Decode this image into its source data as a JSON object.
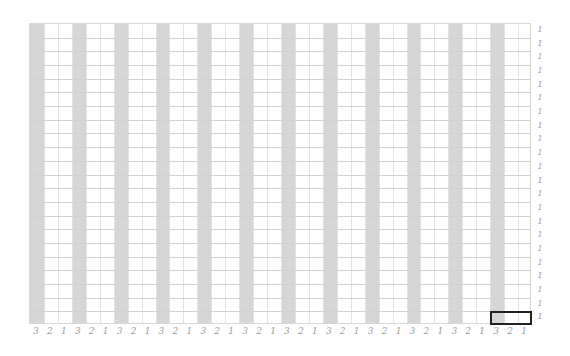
{
  "grid": {
    "columns": 36,
    "rows": 22,
    "left": 29,
    "top": 23,
    "width": 502,
    "height": 301,
    "shaded_every": 3,
    "shaded_offset": 0,
    "shade_color": "#d6d6d6",
    "line_color_vertical": "#e2e2e2",
    "line_color_horizontal": "#d2d2d2",
    "border_color": "#d8d8d8"
  },
  "column_labels": [
    "3",
    "2",
    "1",
    "3",
    "2",
    "1",
    "3",
    "2",
    "1",
    "3",
    "2",
    "1",
    "3",
    "2",
    "1",
    "3",
    "2",
    "1",
    "3",
    "2",
    "1",
    "3",
    "2",
    "1",
    "3",
    "2",
    "1",
    "3",
    "2",
    "1",
    "3",
    "2",
    "1",
    "3",
    "2",
    "1"
  ],
  "row_labels": [
    "1",
    "1",
    "1",
    "1",
    "1",
    "1",
    "1",
    "1",
    "1",
    "1",
    "1",
    "1",
    "1",
    "1",
    "1",
    "1",
    "1",
    "1",
    "1",
    "1",
    "1",
    "1"
  ],
  "selection": {
    "row": 21,
    "col_start": 33,
    "col_span": 3,
    "border_color": "#222222"
  }
}
